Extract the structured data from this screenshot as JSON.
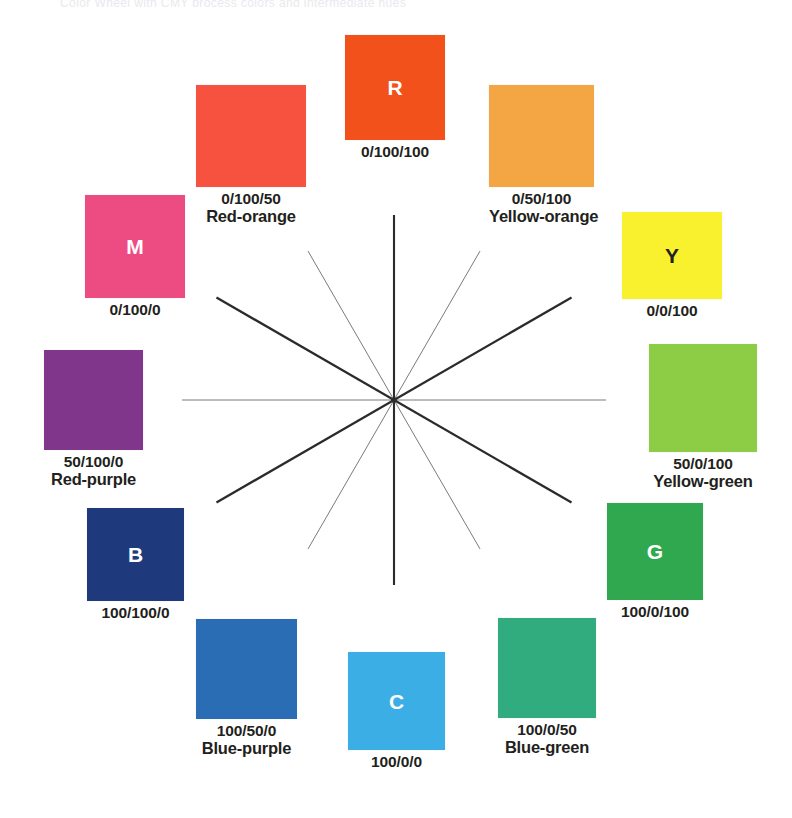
{
  "figure": {
    "kind": "color-wheel",
    "title_sliver": "Color Wheel with CMY process colors and intermediate hues",
    "background": "#ffffff",
    "center": {
      "x": 394,
      "y": 400
    }
  },
  "chart_data": {
    "type": "pie",
    "xlabel": "",
    "ylabel": "",
    "legend_position": "none",
    "grid": false,
    "note": "Twelve hues evenly spaced at 30 degrees around a wheel. Each value is the cyan/magenta/yellow ink percentage printed beneath the chip.",
    "categories": [
      "R",
      "Red-orange",
      "M",
      "Red-purple",
      "B",
      "Blue-purple",
      "C",
      "Blue-green",
      "G",
      "Yellow-green",
      "Y",
      "Yellow-orange"
    ],
    "values": [
      30,
      30,
      30,
      30,
      30,
      30,
      30,
      30,
      30,
      30,
      30,
      30
    ],
    "series": [
      {
        "name": "cyan-percent",
        "values": [
          0,
          0,
          0,
          50,
          100,
          100,
          100,
          100,
          100,
          50,
          0,
          0
        ]
      },
      {
        "name": "magenta-percent",
        "values": [
          100,
          100,
          100,
          100,
          100,
          50,
          0,
          0,
          0,
          0,
          0,
          50
        ]
      },
      {
        "name": "yellow-percent",
        "values": [
          100,
          50,
          0,
          0,
          0,
          0,
          0,
          50,
          100,
          100,
          100,
          100
        ]
      }
    ],
    "angles_degrees": [
      90,
      120,
      150,
      180,
      210,
      240,
      270,
      300,
      330,
      0,
      30,
      60
    ]
  },
  "swatches": [
    {
      "id": "red",
      "letter": "R",
      "letter_color": "light",
      "code": "0/100/100",
      "name": "",
      "color": "#F2511C",
      "angle": 90
    },
    {
      "id": "yellow-orange",
      "letter": "",
      "letter_color": "dark",
      "code": "0/50/100",
      "name": "Yellow-orange",
      "color": "#F4A645",
      "angle": 60
    },
    {
      "id": "yellow",
      "letter": "Y",
      "letter_color": "dark",
      "code": "0/0/100",
      "name": "",
      "color": "#FAF12E",
      "angle": 30
    },
    {
      "id": "yellow-green",
      "letter": "",
      "letter_color": "dark",
      "code": "50/0/100",
      "name": "Yellow-green",
      "color": "#8DCC45",
      "angle": 0
    },
    {
      "id": "green",
      "letter": "G",
      "letter_color": "light",
      "code": "100/0/100",
      "name": "",
      "color": "#2FA84F",
      "angle": 330
    },
    {
      "id": "blue-green",
      "letter": "",
      "letter_color": "dark",
      "code": "100/0/50",
      "name": "Blue-green",
      "color": "#31AC7E",
      "angle": 300
    },
    {
      "id": "cyan",
      "letter": "C",
      "letter_color": "light",
      "code": "100/0/0",
      "name": "",
      "color": "#3AAEE5",
      "angle": 270
    },
    {
      "id": "blue-purple",
      "letter": "",
      "letter_color": "dark",
      "code": "100/50/0",
      "name": "Blue-purple",
      "color": "#2B6DB5",
      "angle": 240
    },
    {
      "id": "blue",
      "letter": "B",
      "letter_color": "light",
      "code": "100/100/0",
      "name": "",
      "color": "#1E3A7C",
      "angle": 210
    },
    {
      "id": "red-purple",
      "letter": "",
      "letter_color": "dark",
      "code": "50/100/0",
      "name": "Red-purple",
      "color": "#80378B",
      "angle": 180
    },
    {
      "id": "magenta",
      "letter": "M",
      "letter_color": "light",
      "code": "0/100/0",
      "name": "",
      "color": "#ED4C82",
      "angle": 150
    },
    {
      "id": "red-orange",
      "letter": "",
      "letter_color": "dark",
      "code": "0/100/50",
      "name": "Red-orange",
      "color": "#F7523F",
      "angle": 120
    }
  ],
  "spokes": {
    "thick_color": "#2B2B2B",
    "thin_color": "#7A7A7A",
    "count": 12
  }
}
